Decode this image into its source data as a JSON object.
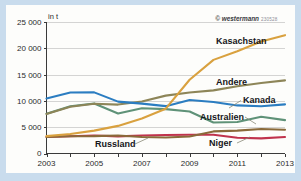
{
  "figure": {
    "unit_label": "in t",
    "credit": "© westermann",
    "credit_code": "230528",
    "frame_color": "#c9dced",
    "panel_color": "#fdfdfb"
  },
  "chart_data": {
    "type": "line",
    "title": "",
    "subtitle": "",
    "xlabel": "",
    "ylabel": "in t",
    "x": [
      2003,
      2004,
      2005,
      2006,
      2007,
      2008,
      2009,
      2010,
      2011,
      2012,
      2013
    ],
    "xticklabels": [
      "2003",
      "2005",
      "2007",
      "2009",
      "2011",
      "2013"
    ],
    "xticks": [
      2003,
      2005,
      2007,
      2009,
      2011,
      2013
    ],
    "xlim": [
      2003,
      2013
    ],
    "yticklabels": [
      "0",
      "5000",
      "10000",
      "15000",
      "20000",
      "25000"
    ],
    "yticks": [
      0,
      5000,
      10000,
      15000,
      20000,
      25000
    ],
    "ylim": [
      0,
      25000
    ],
    "grid": true,
    "grid_axis": "y",
    "legend": "inline-labels",
    "series": [
      {
        "name": "Kasachstan",
        "color": "#d9a13f",
        "values": [
          3300,
          3700,
          4350,
          5250,
          6640,
          8520,
          14020,
          17800,
          19450,
          21300,
          22500
        ]
      },
      {
        "name": "Andere",
        "color": "#8d8558",
        "values": [
          7500,
          8900,
          9450,
          9300,
          9900,
          11000,
          11600,
          12000,
          12800,
          13400,
          13900
        ]
      },
      {
        "name": "Kanada",
        "color": "#2b7dc1",
        "values": [
          10450,
          11600,
          11620,
          9860,
          9480,
          9000,
          10170,
          9780,
          9140,
          8990,
          9330
        ]
      },
      {
        "name": "Australien",
        "color": "#5f9278",
        "values": [
          7570,
          8980,
          9520,
          7590,
          8610,
          8430,
          7980,
          5900,
          5980,
          6990,
          6350
        ]
      },
      {
        "name": "Russland",
        "color": "#c0334d",
        "values": [
          3150,
          3280,
          3430,
          3260,
          3410,
          3520,
          3560,
          3560,
          2990,
          2870,
          3135
        ]
      },
      {
        "name": "Niger",
        "color": "#8a6a3a",
        "values": [
          3150,
          3280,
          3300,
          3430,
          3150,
          3030,
          3240,
          4200,
          4350,
          4670,
          4520
        ]
      }
    ]
  },
  "labels": [
    {
      "text": "Kasachstan",
      "series": "Kasachstan"
    },
    {
      "text": "Andere",
      "series": "Andere"
    },
    {
      "text": "Kanada",
      "series": "Kanada"
    },
    {
      "text": "Australien",
      "series": "Australien"
    },
    {
      "text": "Russland",
      "series": "Russland"
    },
    {
      "text": "Niger",
      "series": "Niger"
    }
  ]
}
